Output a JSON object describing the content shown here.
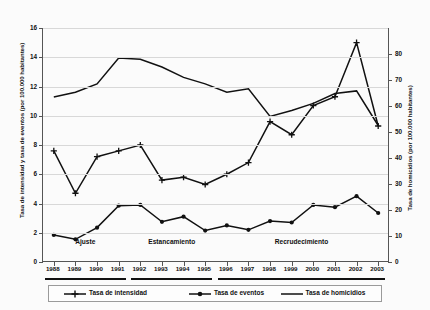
{
  "chart_data": {
    "type": "line",
    "title": "",
    "xlabel": "",
    "ylabel": "Tasa de intensidad y tasa de eventos (por 100.000 habitantes)",
    "ylabel_right": "Tasa de homicidios (por 100.000 habitantes)",
    "categories": [
      "1988",
      "1989",
      "1990",
      "1991",
      "1992",
      "1993",
      "1994",
      "1995",
      "1996",
      "1997",
      "1998",
      "1999",
      "2000",
      "2001",
      "2002",
      "2003"
    ],
    "ylim": [
      0,
      16
    ],
    "yticks": [
      0,
      2,
      4,
      6,
      8,
      10,
      12,
      14,
      16
    ],
    "ylim_right": [
      0,
      90
    ],
    "yticks_right": [
      0,
      10,
      20,
      30,
      40,
      50,
      60,
      70,
      80
    ],
    "grid": true,
    "legend_position": "bottom",
    "series": [
      {
        "name": "Tasa de intensidad",
        "marker": "plus",
        "axis": "left",
        "values": [
          7.6,
          4.7,
          7.2,
          7.6,
          8.0,
          5.6,
          5.8,
          5.3,
          6.0,
          6.8,
          9.6,
          8.7,
          10.7,
          11.3,
          15.0,
          9.3
        ]
      },
      {
        "name": "Tasa de eventos",
        "marker": "circle",
        "axis": "left",
        "values": [
          1.85,
          1.55,
          2.35,
          3.85,
          3.9,
          2.75,
          3.1,
          2.15,
          2.5,
          2.2,
          2.8,
          2.7,
          3.9,
          3.75,
          4.5,
          3.35
        ]
      },
      {
        "name": "Tasa de homicidios",
        "marker": "none",
        "axis": "right",
        "values": [
          63.5,
          65.3,
          68.5,
          78.5,
          78.0,
          75.0,
          71.0,
          68.5,
          65.3,
          66.6,
          56.0,
          58.3,
          61.0,
          64.8,
          65.8,
          52.5
        ]
      }
    ],
    "annotations": [
      {
        "label": "Ajuste",
        "start": "1988",
        "end": "1991"
      },
      {
        "label": "Estancamiento",
        "start": "1992",
        "end": "1995"
      },
      {
        "label": "Recrudecimiento",
        "start": "1996",
        "end": "2003"
      }
    ],
    "colors": {
      "line": "#111111",
      "grid": "#d8d8d8",
      "axis": "#555555",
      "background": "#fbfbfb"
    }
  },
  "legend": {
    "items": [
      {
        "label": "Tasa de intensidad"
      },
      {
        "label": "Tasa de eventos"
      },
      {
        "label": "Tasa de homicidios"
      }
    ]
  }
}
